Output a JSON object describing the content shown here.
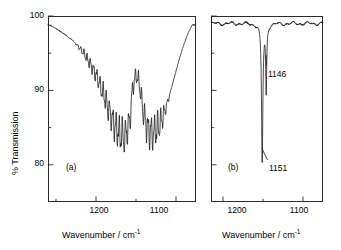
{
  "figure": {
    "type": "ir-transmission-spectrum",
    "background": "#ffffff",
    "line_color": "#1a1a1a",
    "axis_color": "#2b2b2b"
  },
  "axis_titles": {
    "y": "% Transmission",
    "x_a": "Wavenumber / cm",
    "x_a_sup": "-1",
    "x_b": "Wavenumber / cm",
    "x_b_sup": "-1"
  },
  "panel_a": {
    "tag": "(a)",
    "y_ticks_major": [
      "100",
      "90",
      "80"
    ],
    "x_ticks_major": [
      "1200",
      "1100"
    ]
  },
  "panel_b": {
    "tag": "(b)",
    "x_ticks_major": [
      "1200",
      "1100"
    ],
    "annotations": [
      {
        "label": "1146"
      },
      {
        "label": "1151"
      }
    ]
  },
  "chart_data": {
    "type": "line",
    "title": "",
    "xlabel": "Wavenumber / cm^-1",
    "ylabel": "% Transmission",
    "grid": false,
    "legend": "none",
    "panels": [
      {
        "id": "a",
        "tag": "(a)",
        "xlim": [
          1260,
          1075
        ],
        "ylim": [
          75,
          100
        ],
        "x_axis_inverted": true,
        "y_ticks_major": [
          100,
          90,
          80
        ],
        "y_ticks_minor": [
          95,
          85
        ],
        "x_ticks_major": [
          1200,
          1100
        ],
        "x_ticks_minor": [
          1250,
          1150,
          1050
        ],
        "description": "Broad double-minimum absorption band with strong interference fringes superimposed",
        "envelope_x": [
          1258,
          1250,
          1240,
          1230,
          1222,
          1214,
          1206,
          1198,
          1190,
          1183,
          1176,
          1170,
          1164,
          1158,
          1154,
          1150,
          1146,
          1142,
          1138,
          1133,
          1128,
          1122,
          1116,
          1110,
          1104,
          1098,
          1092,
          1086,
          1080
        ],
        "envelope_y": [
          98.8,
          98.3,
          97.6,
          96.8,
          95.9,
          94.8,
          93.4,
          91.6,
          89.3,
          87.0,
          85.2,
          84.0,
          83.6,
          85.8,
          90.5,
          92.2,
          91.0,
          87.8,
          85.6,
          84.4,
          84.3,
          85.0,
          86.6,
          88.6,
          91.0,
          93.4,
          95.6,
          97.4,
          98.8
        ],
        "fringe_region": [
          1228,
          1106
        ],
        "fringe_amplitude": 1.4,
        "fringe_period_cm": 4.0,
        "minima": [
          {
            "x": 1164,
            "y": 83.6
          },
          {
            "x": 1130,
            "y": 84.3
          }
        ],
        "local_maximum": {
          "x": 1150,
          "y": 92.2
        }
      },
      {
        "id": "b",
        "tag": "(b)",
        "xlim": [
          1215,
          1075
        ],
        "ylim": [
          75,
          100
        ],
        "x_axis_inverted": true,
        "y_ticks_major": [
          100,
          90,
          80
        ],
        "y_ticks_minor": [
          95,
          85
        ],
        "x_ticks_major": [
          1200,
          1100
        ],
        "x_ticks_minor": [
          1150,
          1050
        ],
        "description": "Sharp narrow absorption doublet on a flat slightly noisy baseline",
        "baseline_transmission": 99.0,
        "baseline_noise_amplitude": 0.45,
        "peaks": [
          {
            "wavenumber": 1151,
            "min_transmission": 80.3,
            "label": "1151",
            "fwhm_cm": 2.0
          },
          {
            "wavenumber": 1146,
            "min_transmission": 90.0,
            "label": "1146",
            "fwhm_cm": 1.5
          }
        ]
      }
    ]
  }
}
